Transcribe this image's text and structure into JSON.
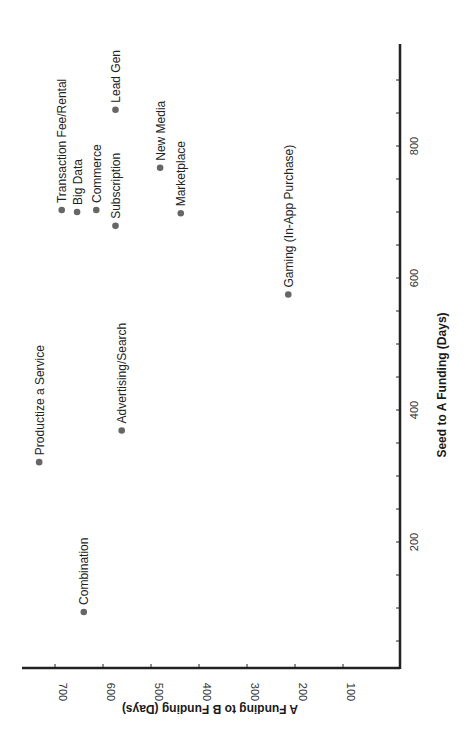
{
  "chart_data": {
    "type": "scatter",
    "orientation_note": "figure is rotated 90 degrees counter-clockwise in the screenshot",
    "title": "",
    "xlabel": "Seed to A Funding (Days)",
    "ylabel": "A Funding to B Funding (Days)",
    "xlim": [
      25,
      960
    ],
    "ylim": [
      0,
      770
    ],
    "x_ticks": [
      200,
      400,
      600,
      800
    ],
    "y_ticks": [
      100,
      200,
      300,
      400,
      500,
      600,
      700
    ],
    "grid": false,
    "legend": null,
    "marker_color": "#666666",
    "points": [
      {
        "label": "Productize a Service",
        "x": 321,
        "y": 733
      },
      {
        "label": "Combination",
        "x": 94,
        "y": 640
      },
      {
        "label": "Advertising/Search",
        "x": 369,
        "y": 561
      },
      {
        "label": "Transaction Fee/Rental",
        "x": 703,
        "y": 686
      },
      {
        "label": "Big Data",
        "x": 700,
        "y": 654
      },
      {
        "label": "Commerce",
        "x": 703,
        "y": 614
      },
      {
        "label": "Subscription",
        "x": 679,
        "y": 574
      },
      {
        "label": "Lead Gen",
        "x": 855,
        "y": 574
      },
      {
        "label": "New Media",
        "x": 767,
        "y": 481
      },
      {
        "label": "Marketplace",
        "x": 698,
        "y": 438
      },
      {
        "label": "Gaming (In-App Purchase)",
        "x": 575,
        "y": 214
      }
    ]
  },
  "axes": {
    "x_title": "Seed to A Funding (Days)",
    "y_title": "A Funding to B Funding (Days)",
    "x_tick_labels": [
      "200",
      "400",
      "600",
      "800"
    ],
    "y_tick_labels": [
      "700",
      "600",
      "500",
      "400",
      "300",
      "200",
      "100"
    ]
  }
}
